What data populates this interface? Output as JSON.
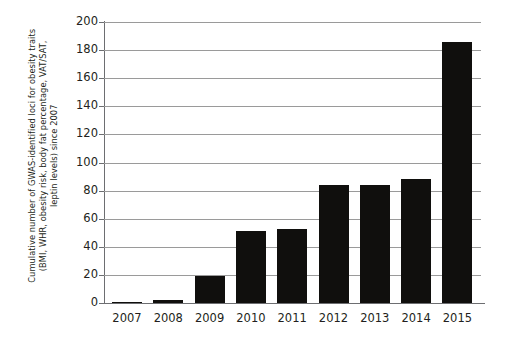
{
  "chart_data": {
    "type": "bar",
    "title": "",
    "subtitle": "",
    "xlabel": "",
    "ylabel": "Cumulative number of GWAS-identified loci for obesity traits (BMI, WHR, obesity risk, body fat percentage, VAT/SAT, leptin levels) since 2007",
    "ylabel_lines": [
      "Cumulative number of GWAS-identified loci for obesity traits",
      "(BMI, WHR, obesity risk, body fat percentage, VAT/SAT,",
      "leptin levels) since 2007"
    ],
    "categories": [
      "2007",
      "2008",
      "2009",
      "2010",
      "2011",
      "2012",
      "2013",
      "2014",
      "2015"
    ],
    "values": [
      1,
      2,
      19,
      51,
      53,
      84,
      84,
      88,
      186
    ],
    "ylim": [
      0,
      200
    ],
    "yticks": [
      0,
      20,
      40,
      60,
      80,
      100,
      120,
      140,
      160,
      180,
      200
    ],
    "ytick_labels": [
      "0",
      "20",
      "40",
      "60",
      "80",
      "100",
      "120",
      "140",
      "160",
      "180",
      "200"
    ],
    "grid": true,
    "grid_axis": "y",
    "legend": null,
    "legend_position": "none",
    "bar_color": "#100f0d",
    "grid_color": "#9a9a9a",
    "axis_color": "#6d6e71",
    "background_color": "#ffffff",
    "text_color": "#231f20"
  }
}
